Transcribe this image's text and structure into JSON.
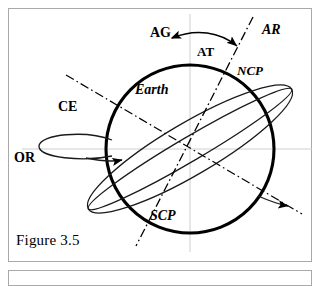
{
  "figure": {
    "caption": "Figure 3.5"
  },
  "labels": {
    "axis_of_globe": "AG",
    "axis_of_rotation": "AR",
    "axis_tilt": "AT",
    "north_celestial_pole": "NCP",
    "south_celestial_pole": "SCP",
    "earth": "Earth",
    "celestial_equator": "CE",
    "orbital_rotation": "OR"
  },
  "colors": {
    "stroke": "#000000",
    "frame": "#a9a9a9",
    "guide": "#cccccc",
    "background": "#ffffff"
  },
  "geometry": {
    "circle": {
      "cx": 190,
      "cy": 149,
      "r": 84
    },
    "rotation_axis": {
      "x1": 253,
      "y1": 17,
      "x2": 136,
      "y2": 246
    },
    "equator_axis": {
      "x1": 66,
      "y1": 75,
      "x2": 302,
      "y2": 214
    },
    "guide_horizontal_y": 149,
    "guide_vertical_x": 190
  }
}
